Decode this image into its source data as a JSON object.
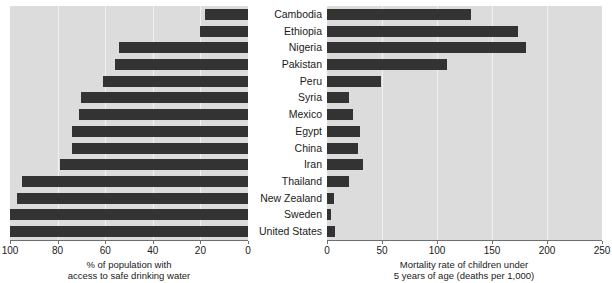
{
  "chart_data": {
    "type": "bar",
    "orientation": "horizontal",
    "layout": "two-panel mirrored (population pyramid style)",
    "categories": [
      "Cambodia",
      "Ethiopia",
      "Nigeria",
      "Pakistan",
      "Peru",
      "Syria",
      "Mexico",
      "Egypt",
      "China",
      "Iran",
      "Thailand",
      "New Zealand",
      "Sweden",
      "United States"
    ],
    "panels": [
      {
        "id": "left",
        "title": "",
        "xlabel_line1": "% of population with",
        "xlabel_line2": "access to safe drinking water",
        "direction": "right-to-left",
        "xlim": [
          0,
          100
        ],
        "xticks": [
          100,
          80,
          60,
          40,
          20,
          0
        ],
        "xtick_labels": [
          "100",
          "80",
          "60",
          "40",
          "20",
          "0"
        ],
        "grid": true,
        "series_name": "% of population with access to safe drinking water",
        "values": [
          18,
          20,
          54,
          56,
          61,
          70,
          71,
          74,
          74,
          79,
          95,
          97,
          100,
          100
        ]
      },
      {
        "id": "right",
        "title": "",
        "xlabel_line1": "Mortality rate of children under",
        "xlabel_line2": "5 years of age (deaths per 1,000)",
        "direction": "left-to-right",
        "xlim": [
          0,
          250
        ],
        "xticks": [
          0,
          50,
          100,
          150,
          200,
          250
        ],
        "xtick_labels": [
          "0",
          "50",
          "100",
          "150",
          "200",
          "250"
        ],
        "grid": true,
        "series_name": "Mortality rate of children under 5 years of age (deaths per 1,000)",
        "values": [
          131,
          174,
          181,
          109,
          49,
          20,
          24,
          30,
          28,
          33,
          20,
          6,
          4,
          7
        ]
      }
    ],
    "colors": {
      "bar": "#333333",
      "panel_background": "#dcdcdc",
      "gridline": "#f2f2f2",
      "axis": "#6e6e6e",
      "text": "#1a1a1a",
      "page_background": "#ffffff"
    }
  }
}
